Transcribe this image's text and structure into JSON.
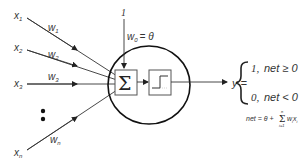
{
  "diagram": {
    "title": "",
    "type": "perceptron",
    "colors": {
      "stroke": "#222222",
      "text": "#333333",
      "background": "#ffffff"
    },
    "inputs": [
      {
        "label": "x",
        "sub": "1",
        "weight": "w",
        "weight_sub": "1"
      },
      {
        "label": "x",
        "sub": "2",
        "weight": "w",
        "weight_sub": "2"
      },
      {
        "label": "x",
        "sub": "3",
        "weight": "w",
        "weight_sub": "3"
      },
      {
        "label": "x",
        "sub": "n",
        "weight": "w",
        "weight_sub": "n"
      }
    ],
    "ellipsis": "•",
    "bias": {
      "input": "1",
      "weight": "w",
      "weight_sub": "0",
      "equals": "= θ"
    },
    "summation_symbol": "Σ",
    "activation": "step-function",
    "output": {
      "lhs": "y =",
      "cases": [
        {
          "value": "1,",
          "condition": "net ≥ 0"
        },
        {
          "value": "0,",
          "condition": "net < 0"
        }
      ]
    },
    "net_formula": {
      "lhs": "net = θ +",
      "sum": "Σ",
      "upper": "n",
      "lower": "i=1",
      "term": "w",
      "term_sub": "i",
      "var": "x",
      "var_sub": "i"
    }
  }
}
